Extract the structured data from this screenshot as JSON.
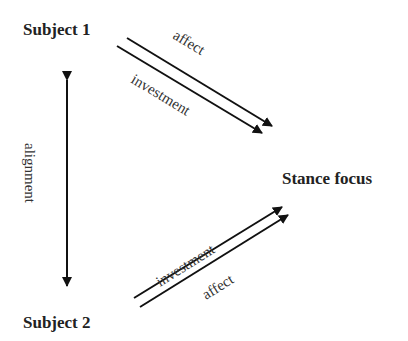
{
  "diagram": {
    "type": "stance-triangle",
    "nodes": {
      "subject1": "Subject 1",
      "subject2": "Subject 2",
      "stance_focus": "Stance focus"
    },
    "edges": {
      "s1_affect": "affect",
      "s1_investment": "investment",
      "alignment": "alignment",
      "s2_investment": "investment",
      "s2_affect": "affect"
    },
    "colors": {
      "line": "#111111",
      "text": "#222222",
      "background": "#ffffff"
    }
  }
}
